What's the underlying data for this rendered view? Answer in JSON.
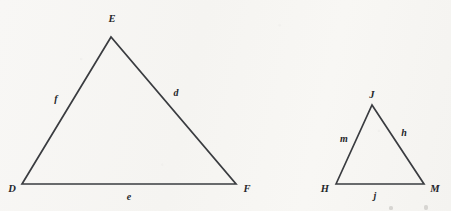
{
  "figure": {
    "background_color": "#f7f6f3",
    "stroke_color": "#3a3c40",
    "label_color": "#24262a",
    "triangles": [
      {
        "id": "DEF",
        "name": "large-triangle-def",
        "vertices": [
          {
            "label": "D",
            "x": 22,
            "y": 184,
            "label_x": 12,
            "label_y": 189
          },
          {
            "label": "E",
            "x": 111,
            "y": 37,
            "label_x": 112,
            "label_y": 19
          },
          {
            "label": "F",
            "x": 236,
            "y": 184,
            "label_x": 247,
            "label_y": 189
          }
        ],
        "sides": [
          {
            "label": "f",
            "name": "side-f",
            "from": "D",
            "to": "E",
            "label_x": 56,
            "label_y": 99
          },
          {
            "label": "d",
            "name": "side-d",
            "from": "E",
            "to": "F",
            "label_x": 176,
            "label_y": 93
          },
          {
            "label": "e",
            "name": "side-e",
            "from": "D",
            "to": "F",
            "label_x": 129,
            "label_y": 197
          }
        ]
      },
      {
        "id": "HJM",
        "name": "small-triangle-hjm",
        "vertices": [
          {
            "label": "H",
            "x": 336,
            "y": 184,
            "label_x": 325,
            "label_y": 189
          },
          {
            "label": "J",
            "x": 372,
            "y": 105,
            "label_x": 372,
            "label_y": 95
          },
          {
            "label": "M",
            "x": 424,
            "y": 184,
            "label_x": 435,
            "label_y": 189
          }
        ],
        "sides": [
          {
            "label": "m",
            "name": "side-m",
            "from": "H",
            "to": "J",
            "label_x": 344,
            "label_y": 139
          },
          {
            "label": "h",
            "name": "side-h",
            "from": "J",
            "to": "M",
            "label_x": 404,
            "label_y": 133
          },
          {
            "label": "j",
            "name": "side-j",
            "from": "H",
            "to": "M",
            "label_x": 375,
            "label_y": 196
          }
        ]
      }
    ]
  }
}
